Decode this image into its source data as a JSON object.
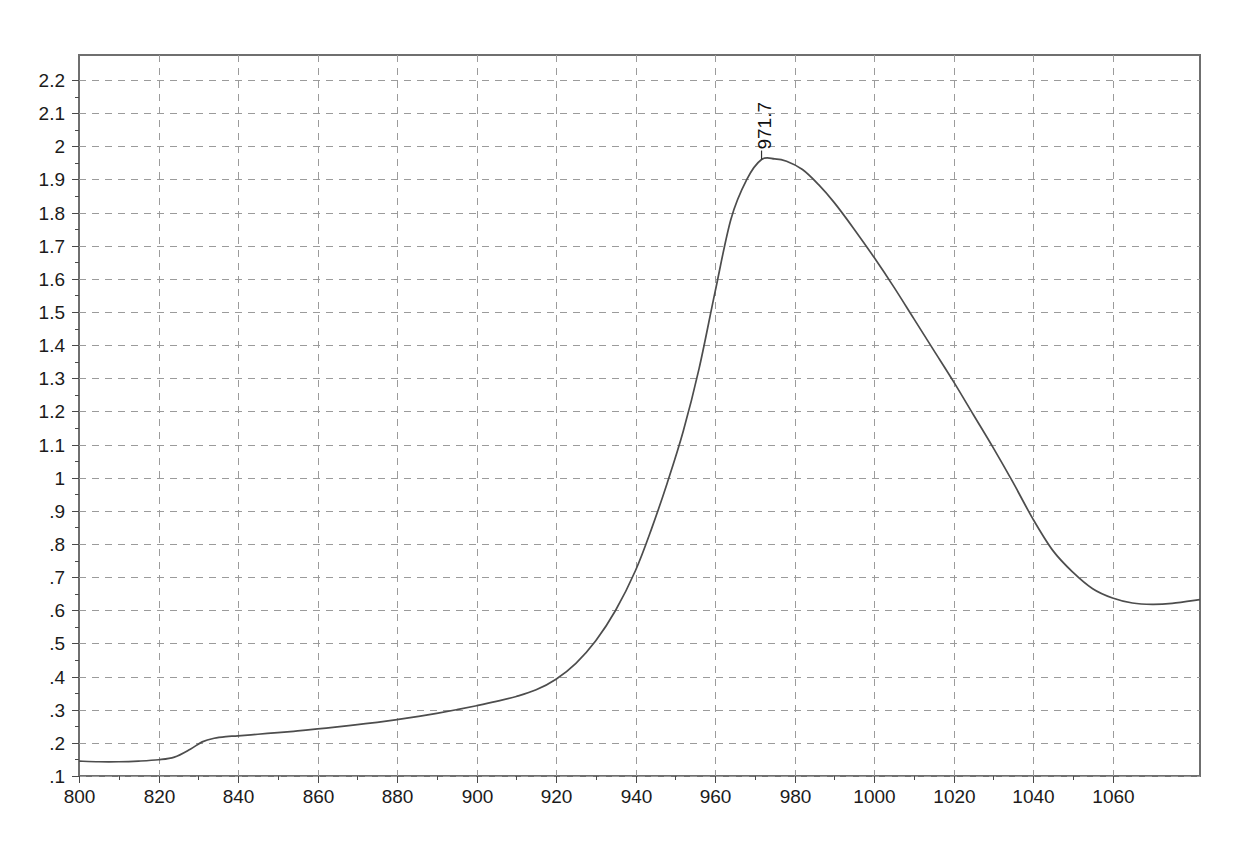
{
  "chart_data": {
    "type": "line",
    "title": "",
    "subtitle": "",
    "xlabel": "",
    "ylabel": "",
    "xlim": [
      800,
      1082
    ],
    "ylim": [
      0.1,
      2.27
    ],
    "grid": true,
    "legend": null,
    "legend_position": "none",
    "x_tick_labels": [
      "800",
      "820",
      "840",
      "860",
      "880",
      "900",
      "920",
      "940",
      "960",
      "980",
      "1000",
      "1020",
      "1040",
      "1060"
    ],
    "x_ticks": [
      800,
      820,
      840,
      860,
      880,
      900,
      920,
      940,
      960,
      980,
      1000,
      1020,
      1040,
      1060
    ],
    "y_tick_labels": [
      "2.2",
      "2.1",
      "2",
      "1.9",
      "1.8",
      "1.7",
      "1.6",
      "1.5",
      "1.4",
      "1.3",
      "1.2",
      "1.1",
      "1",
      ".9",
      ".8",
      ".7",
      ".6",
      ".5",
      ".4",
      ".3",
      ".2",
      ".1"
    ],
    "y_ticks": [
      2.2,
      2.1,
      2.0,
      1.9,
      1.8,
      1.7,
      1.6,
      1.5,
      1.4,
      1.3,
      1.2,
      1.1,
      1.0,
      0.9,
      0.8,
      0.7,
      0.6,
      0.5,
      0.4,
      0.3,
      0.2,
      0.1
    ],
    "annotations": [
      {
        "text": "971.7",
        "x": 971.7,
        "y": 1.96,
        "rotation": -90,
        "name": "peak-label-971-7"
      }
    ],
    "series": [
      {
        "name": "spectrum",
        "color": "#4d4d4d",
        "x": [
          800,
          805,
          810,
          815,
          820,
          824,
          828,
          831,
          834,
          837,
          840,
          845,
          850,
          855,
          860,
          865,
          870,
          875,
          880,
          885,
          890,
          895,
          900,
          905,
          910,
          915,
          920,
          925,
          930,
          935,
          940,
          944,
          948,
          952,
          956,
          960,
          964,
          968,
          971.7,
          975,
          978,
          982,
          986,
          990,
          995,
          1000,
          1005,
          1010,
          1015,
          1020,
          1025,
          1030,
          1035,
          1040,
          1045,
          1050,
          1055,
          1060,
          1065,
          1070,
          1075,
          1082
        ],
        "y": [
          0.145,
          0.143,
          0.143,
          0.145,
          0.149,
          0.157,
          0.181,
          0.203,
          0.214,
          0.219,
          0.221,
          0.226,
          0.231,
          0.236,
          0.242,
          0.248,
          0.255,
          0.262,
          0.27,
          0.279,
          0.289,
          0.3,
          0.312,
          0.325,
          0.34,
          0.36,
          0.392,
          0.44,
          0.508,
          0.6,
          0.72,
          0.845,
          0.985,
          1.14,
          1.33,
          1.56,
          1.78,
          1.9,
          1.96,
          1.962,
          1.955,
          1.93,
          1.885,
          1.83,
          1.75,
          1.665,
          1.575,
          1.48,
          1.385,
          1.29,
          1.19,
          1.09,
          0.985,
          0.875,
          0.78,
          0.715,
          0.665,
          0.637,
          0.622,
          0.618,
          0.621,
          0.632
        ]
      }
    ]
  },
  "plot": {
    "frame": {
      "left": 79,
      "top": 55,
      "right": 1200,
      "bottom": 776
    },
    "background_color": "#ffffff",
    "grid_color": "#9b9b9b",
    "frame_color": "#6f6f6f"
  }
}
